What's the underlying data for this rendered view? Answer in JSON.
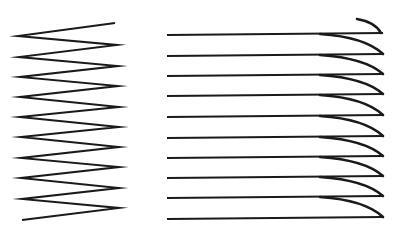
{
  "figure": {
    "background": "#ffffff",
    "stroke_color": "#1a1a1a",
    "left_zigzag": {
      "description": "zigzag spring-like line",
      "points": [
        [
          115,
          23
        ],
        [
          18,
          36
        ],
        [
          117,
          45
        ],
        [
          19,
          57
        ],
        [
          118,
          66
        ],
        [
          20,
          77
        ],
        [
          118,
          86
        ],
        [
          20,
          97
        ],
        [
          119,
          107
        ],
        [
          20,
          117
        ],
        [
          119,
          127
        ],
        [
          21,
          137
        ],
        [
          119,
          147
        ],
        [
          21,
          158
        ],
        [
          119,
          167
        ],
        [
          21,
          178
        ],
        [
          119,
          188
        ],
        [
          22,
          199
        ],
        [
          119,
          208
        ],
        [
          22,
          220
        ]
      ]
    },
    "right_lines": {
      "description": "stacked horizontal lines with curved downward right ends",
      "start_x": 167,
      "bend_x": 320,
      "end_x": 383,
      "rows_y": [
        34,
        55,
        75,
        95,
        116,
        137,
        157,
        177,
        197,
        218
      ],
      "top_hook": {
        "from": [
          357,
          19
        ],
        "to": [
          381,
          30
        ]
      }
    }
  }
}
